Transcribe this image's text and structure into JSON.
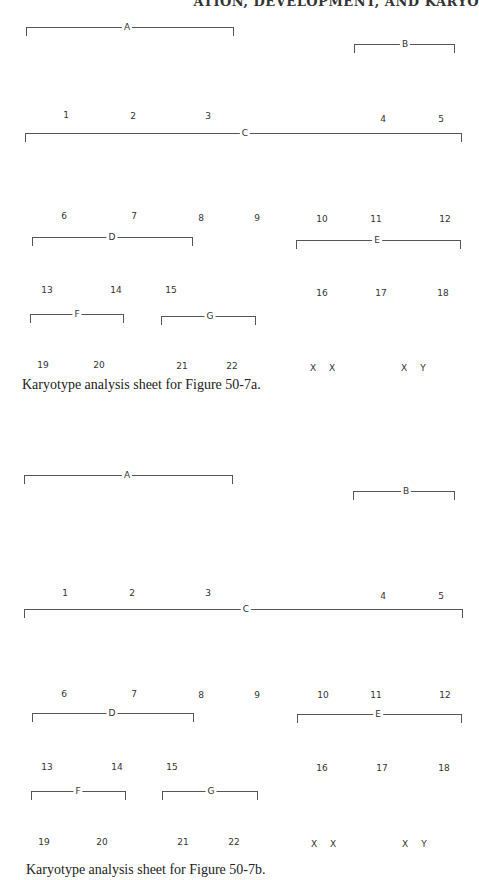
{
  "running_head": "ATION, DEVELOPMENT, AND KARYO",
  "sheets": [
    {
      "caption": "Karyotype analysis sheet for Figure 50-7a.",
      "groups": {
        "A": "A",
        "B": "B",
        "C": "C",
        "D": "D",
        "E": "E",
        "F": "F",
        "G": "G"
      },
      "chromosomes": [
        "1",
        "2",
        "3",
        "4",
        "5",
        "6",
        "7",
        "8",
        "9",
        "10",
        "11",
        "12",
        "13",
        "14",
        "15",
        "16",
        "17",
        "18",
        "19",
        "20",
        "21",
        "22",
        "X",
        "X",
        "X",
        "Y"
      ]
    },
    {
      "caption": "Karyotype analysis sheet for Figure 50-7b.",
      "groups": {
        "A": "A",
        "B": "B",
        "C": "C",
        "D": "D",
        "E": "E",
        "F": "F",
        "G": "G"
      },
      "chromosomes": [
        "1",
        "2",
        "3",
        "4",
        "5",
        "6",
        "7",
        "8",
        "9",
        "10",
        "11",
        "12",
        "13",
        "14",
        "15",
        "16",
        "17",
        "18",
        "19",
        "20",
        "21",
        "22",
        "X",
        "X",
        "X",
        "Y"
      ]
    }
  ]
}
